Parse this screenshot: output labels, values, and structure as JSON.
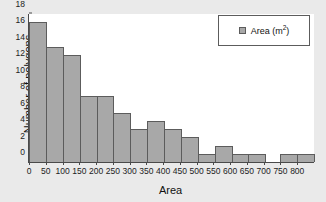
{
  "chart_data": {
    "type": "bar",
    "title": "",
    "xlabel": "Area",
    "ylabel": "Number of polygons",
    "categories": [
      "0-50",
      "50-100",
      "100-150",
      "150-200",
      "200-250",
      "250-300",
      "300-350",
      "350-400",
      "400-450",
      "450-500",
      "500-550",
      "550-600",
      "600-650",
      "650-700",
      "700-750",
      "750-800",
      "800-850"
    ],
    "bin_starts": [
      0,
      50,
      100,
      150,
      200,
      250,
      300,
      350,
      400,
      450,
      500,
      550,
      600,
      650,
      700,
      750,
      800
    ],
    "bin_width": 50,
    "values": [
      17,
      14,
      13,
      8,
      8,
      6,
      4,
      5,
      4,
      3,
      1,
      2,
      1,
      1,
      0,
      1,
      1
    ],
    "xlim": [
      0,
      850
    ],
    "ylim": [
      0,
      18
    ],
    "xticks": [
      0,
      50,
      100,
      150,
      200,
      250,
      300,
      350,
      400,
      450,
      500,
      550,
      600,
      650,
      700,
      750,
      800
    ],
    "xticklabels": [
      "0",
      "50",
      "100",
      "150",
      "200",
      "250",
      "300",
      "350",
      "400",
      "450",
      "500",
      "550",
      "600",
      "650",
      "700",
      "750",
      "800"
    ],
    "yticks": [
      0,
      2,
      4,
      6,
      8,
      10,
      12,
      14,
      16,
      18
    ],
    "yticklabels": [
      "0",
      "2",
      "4",
      "6",
      "8",
      "10",
      "12",
      "14",
      "16",
      "18"
    ],
    "grid": false,
    "legend": {
      "position": "top-right",
      "entries": [
        {
          "label": "Area (m",
          "unit_exponent": "2",
          "label_suffix": ")",
          "color": "#a8a8a8"
        }
      ]
    },
    "colors": {
      "bar_fill": "#a8a8a8",
      "bar_edge": "#5c5c5c",
      "axis": "#4a4a4a",
      "plot_background": "#ffffff",
      "figure_background": "#eaeaea",
      "text": "#111111"
    }
  }
}
